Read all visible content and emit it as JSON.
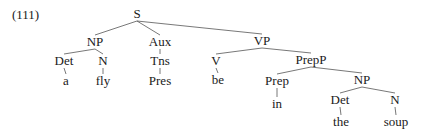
{
  "example_number": "(111)",
  "tree": {
    "nodes": [
      {
        "id": "S",
        "label": "S",
        "x": 137,
        "y": 14
      },
      {
        "id": "NP1",
        "label": "NP",
        "x": 95,
        "y": 42
      },
      {
        "id": "Aux",
        "label": "Aux",
        "x": 160,
        "y": 42
      },
      {
        "id": "VP",
        "label": "VP",
        "x": 262,
        "y": 41
      },
      {
        "id": "Det1",
        "label": "Det",
        "x": 64,
        "y": 61
      },
      {
        "id": "N1",
        "label": "N",
        "x": 103,
        "y": 61
      },
      {
        "id": "Tns",
        "label": "Tns",
        "x": 160,
        "y": 61
      },
      {
        "id": "a",
        "label": "a",
        "x": 66,
        "y": 81
      },
      {
        "id": "fly",
        "label": "fly",
        "x": 103,
        "y": 81
      },
      {
        "id": "Pres",
        "label": "Pres",
        "x": 160,
        "y": 81
      },
      {
        "id": "V",
        "label": "V",
        "x": 216,
        "y": 61
      },
      {
        "id": "be",
        "label": "be",
        "x": 218,
        "y": 80
      },
      {
        "id": "PrepP",
        "label": "PrepP",
        "x": 311,
        "y": 60
      },
      {
        "id": "Prep",
        "label": "Prep",
        "x": 277,
        "y": 81
      },
      {
        "id": "in",
        "label": "in",
        "x": 277,
        "y": 104
      },
      {
        "id": "NP2",
        "label": "NP",
        "x": 362,
        "y": 80
      },
      {
        "id": "Det2",
        "label": "Det",
        "x": 340,
        "y": 100
      },
      {
        "id": "the",
        "label": "the",
        "x": 341,
        "y": 122
      },
      {
        "id": "N2",
        "label": "N",
        "x": 395,
        "y": 100
      },
      {
        "id": "soup",
        "label": "soup",
        "x": 396,
        "y": 122
      }
    ],
    "edges": [
      [
        "S",
        "NP1"
      ],
      [
        "S",
        "Aux"
      ],
      [
        "S",
        "VP"
      ],
      [
        "NP1",
        "Det1"
      ],
      [
        "NP1",
        "N1"
      ],
      [
        "Aux",
        "Tns"
      ],
      [
        "Det1",
        "a"
      ],
      [
        "N1",
        "fly"
      ],
      [
        "Tns",
        "Pres"
      ],
      [
        "VP",
        "V"
      ],
      [
        "VP",
        "PrepP"
      ],
      [
        "V",
        "be"
      ],
      [
        "PrepP",
        "Prep"
      ],
      [
        "PrepP",
        "NP2"
      ],
      [
        "Prep",
        "in"
      ],
      [
        "NP2",
        "Det2"
      ],
      [
        "NP2",
        "N2"
      ],
      [
        "Det2",
        "the"
      ],
      [
        "N2",
        "soup"
      ]
    ]
  }
}
